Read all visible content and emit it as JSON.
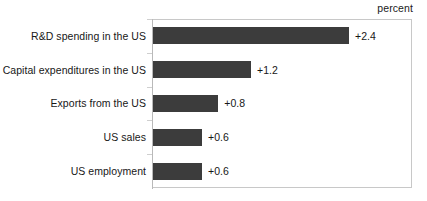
{
  "unit_caption": "percent",
  "chart_data": {
    "type": "bar",
    "orientation": "horizontal",
    "title": "",
    "subtitle": "",
    "xlabel": "percent",
    "ylabel": "",
    "unit": "percent",
    "grid": false,
    "legend": null,
    "xlim": [
      0,
      3.18
    ],
    "bar_color": "#3c3c3c",
    "frame_color": "#c8c8c8",
    "text_color": "#171717",
    "categories": [
      "R&D spending in the US",
      "Capital expenditures in the US",
      "Exports from the US",
      "US sales",
      "US employment"
    ],
    "values": [
      2.4,
      1.2,
      0.8,
      0.6,
      0.6
    ],
    "value_labels": [
      "+2.4",
      "+1.2",
      "+0.8",
      "+0.6",
      "+0.6"
    ],
    "bars": [
      {
        "label": "R&D spending in the US",
        "value": 2.4,
        "value_label": "+2.4"
      },
      {
        "label": "Capital expenditures in the US",
        "value": 1.2,
        "value_label": "+1.2"
      },
      {
        "label": "Exports from the US",
        "value": 0.8,
        "value_label": "+0.8"
      },
      {
        "label": "US sales",
        "value": 0.6,
        "value_label": "+0.6"
      },
      {
        "label": "US employment",
        "value": 0.6,
        "value_label": "+0.6"
      }
    ]
  }
}
